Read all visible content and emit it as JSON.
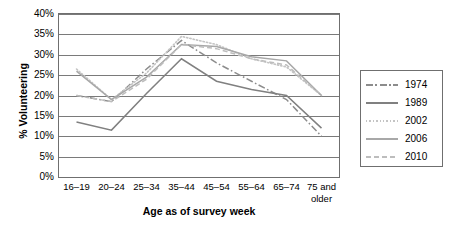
{
  "chart_data": {
    "type": "line",
    "title": "",
    "xlabel": "Age as of survey week",
    "ylabel": "% Volunteering",
    "categories": [
      "16–19",
      "20–24",
      "25–34",
      "35–44",
      "45–54",
      "55–64",
      "65–74",
      "75 and older"
    ],
    "category_lines": [
      [
        "16–19"
      ],
      [
        "20–24"
      ],
      [
        "25–34"
      ],
      [
        "35–44"
      ],
      [
        "45–54"
      ],
      [
        "55–64"
      ],
      [
        "65–74"
      ],
      [
        "75 and",
        "older"
      ]
    ],
    "ylim": [
      0,
      40
    ],
    "ytick_values": [
      0,
      5,
      10,
      15,
      20,
      25,
      30,
      35,
      40
    ],
    "ytick_labels": [
      "0%",
      "5%",
      "10%",
      "15%",
      "20%",
      "25%",
      "30%",
      "35%",
      "40%"
    ],
    "grid": true,
    "legend_position": "right",
    "series": [
      {
        "name": "1974",
        "style": "dashdot",
        "color": "#8c8c8c",
        "values": [
          20.0,
          18.5,
          26.5,
          33.5,
          28.0,
          23.5,
          19.0,
          10.0
        ]
      },
      {
        "name": "1989",
        "style": "solid",
        "color": "#808080",
        "values": [
          13.5,
          11.5,
          20.5,
          29.0,
          23.5,
          21.5,
          20.0,
          12.0
        ]
      },
      {
        "name": "2002",
        "style": "dotted",
        "color": "#c4c4c4",
        "values": [
          26.5,
          19.0,
          25.5,
          34.5,
          32.5,
          29.0,
          27.0,
          20.0
        ]
      },
      {
        "name": "2006",
        "style": "solid",
        "color": "#a8a8a8",
        "values": [
          26.0,
          19.0,
          24.5,
          32.5,
          32.0,
          29.5,
          28.5,
          20.0
        ]
      },
      {
        "name": "2010",
        "style": "dashed",
        "color": "#bdbdbd",
        "values": [
          20.0,
          18.5,
          24.0,
          32.5,
          31.5,
          29.0,
          27.5,
          20.0
        ]
      }
    ]
  },
  "legend": {
    "items": [
      {
        "label": "1974"
      },
      {
        "label": "1989"
      },
      {
        "label": "2002"
      },
      {
        "label": "2006"
      },
      {
        "label": "2010"
      }
    ]
  }
}
